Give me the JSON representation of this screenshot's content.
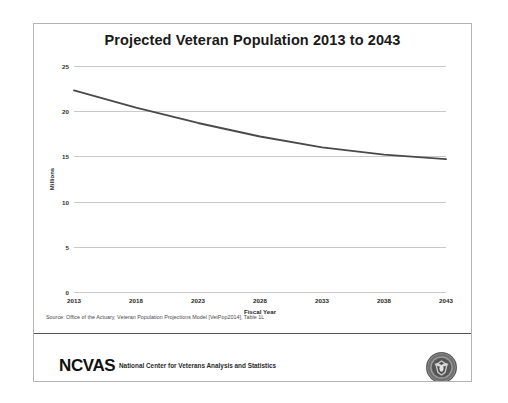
{
  "slide": {
    "title": "Projected Veteran Population 2013 to 2043",
    "source_note": "Source: Office of the Actuary, Veteran Population Projections  Model  [VetPop2014], Table 1L"
  },
  "footer": {
    "wordmark": "NCVAS",
    "tagline": "National Center for Veterans Analysis and Statistics",
    "seal_icon": "va-seal-icon"
  },
  "colors": {
    "line": "#4a4a4a",
    "grid": "#c9c9c9",
    "text": "#1a1a1a",
    "rule": "#545454",
    "card_border": "#b4b4b4"
  },
  "chart_data": {
    "type": "line",
    "title": "Projected Veteran Population 2013 to 2043",
    "xlabel": "Fiscal Year",
    "ylabel": "Millions",
    "x": [
      2013,
      2018,
      2023,
      2028,
      2033,
      2038,
      2043
    ],
    "xticklabels": [
      "2013",
      "2018",
      "2023",
      "2028",
      "2033",
      "2038",
      "2043"
    ],
    "yticklabels": [
      "0",
      "5",
      "10",
      "15",
      "20",
      "25"
    ],
    "yticks": [
      0,
      5,
      10,
      15,
      20,
      25
    ],
    "xlim": [
      2013,
      2043
    ],
    "ylim": [
      0,
      25
    ],
    "grid": "horizontal",
    "legend": "none",
    "series": [
      {
        "name": "Projected Veteran Population",
        "values": [
          22.3,
          20.4,
          18.7,
          17.2,
          16.0,
          15.2,
          14.7
        ]
      }
    ]
  }
}
